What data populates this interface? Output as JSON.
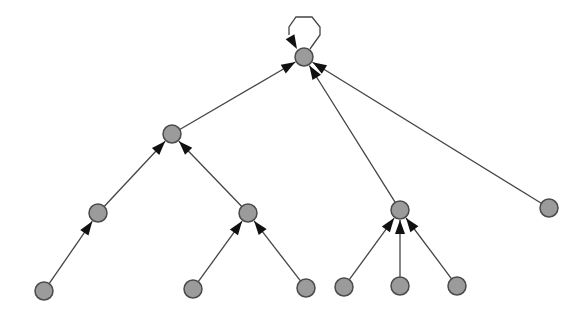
{
  "diagram": {
    "type": "directed-tree",
    "colors": {
      "node_fill": "#9b9b9b",
      "node_stroke": "#4a4a4a",
      "edge": "#444444",
      "arrowhead": "#111111",
      "background": "#ffffff"
    },
    "node_radius": 9,
    "nodes": [
      {
        "id": "n0",
        "x": 304,
        "y": 57
      },
      {
        "id": "n1",
        "x": 172,
        "y": 134
      },
      {
        "id": "n2",
        "x": 98,
        "y": 213
      },
      {
        "id": "n3",
        "x": 248,
        "y": 213
      },
      {
        "id": "n4",
        "x": 400,
        "y": 210
      },
      {
        "id": "n5",
        "x": 549,
        "y": 208
      },
      {
        "id": "n6",
        "x": 44,
        "y": 291
      },
      {
        "id": "n7",
        "x": 193,
        "y": 289
      },
      {
        "id": "n8",
        "x": 306,
        "y": 288
      },
      {
        "id": "n9",
        "x": 344,
        "y": 287
      },
      {
        "id": "n10",
        "x": 400,
        "y": 286
      },
      {
        "id": "n11",
        "x": 457,
        "y": 286
      }
    ],
    "edges": [
      {
        "from": "n0",
        "to": "n0",
        "self_loop": true
      },
      {
        "from": "n1",
        "to": "n0"
      },
      {
        "from": "n4",
        "to": "n0"
      },
      {
        "from": "n5",
        "to": "n0"
      },
      {
        "from": "n2",
        "to": "n1"
      },
      {
        "from": "n3",
        "to": "n1"
      },
      {
        "from": "n6",
        "to": "n2"
      },
      {
        "from": "n7",
        "to": "n3"
      },
      {
        "from": "n8",
        "to": "n3"
      },
      {
        "from": "n9",
        "to": "n4"
      },
      {
        "from": "n10",
        "to": "n4"
      },
      {
        "from": "n11",
        "to": "n4"
      }
    ]
  }
}
